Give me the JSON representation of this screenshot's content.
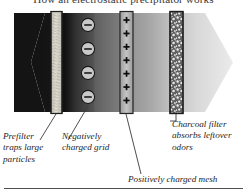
{
  "figure": {
    "title": "How an electrostatic precipitator works",
    "type": "labeled-cutaway-diagram",
    "background_color": "#ffffff",
    "ink_color": "#262626"
  },
  "airflow": {
    "direction": "left-to-right",
    "inlet_shape": "chevron-notch",
    "outlet_shape": "chevron-point",
    "dirty_air_color": "#151515",
    "clean_air_color": "#e9e9e9"
  },
  "stages": [
    {
      "id": "prefilter",
      "order": 1,
      "name": "Prefilter",
      "fill": "#d8d5cc",
      "border": "#2b2b2b",
      "texture": "fibrous-streaks"
    },
    {
      "id": "negative-grid",
      "order": 2,
      "name": "Negatively charged grid",
      "charge_symbol": "−",
      "charge_count": 4,
      "symbol_fill": "#cfcfcf",
      "symbol_border": "#1f1f1f"
    },
    {
      "id": "positive-mesh",
      "order": 3,
      "name": "Positively charged mesh",
      "charge_symbol": "+",
      "charge_count": 7,
      "fill": "#b9b9b9",
      "border": "#2b2b2b"
    },
    {
      "id": "charcoal-filter",
      "order": 4,
      "name": "Charcoal filter",
      "fill": "#767676",
      "border": "#2b2b2b",
      "texture": "granular-speckle"
    }
  ],
  "callouts": [
    {
      "id": "prefilter",
      "text": "Prefilter\ntraps large\nparticles",
      "align": "left"
    },
    {
      "id": "negative-grid",
      "text": "Negatively\ncharged grid",
      "align": "left"
    },
    {
      "id": "charcoal-filter",
      "text": "Charcoal filter\nabsorbs leftover\nodors",
      "align": "left"
    },
    {
      "id": "positive-mesh",
      "text": "Positively charged mesh",
      "align": "left"
    }
  ],
  "footer": {
    "rule": true,
    "rule_color": "#555555"
  }
}
